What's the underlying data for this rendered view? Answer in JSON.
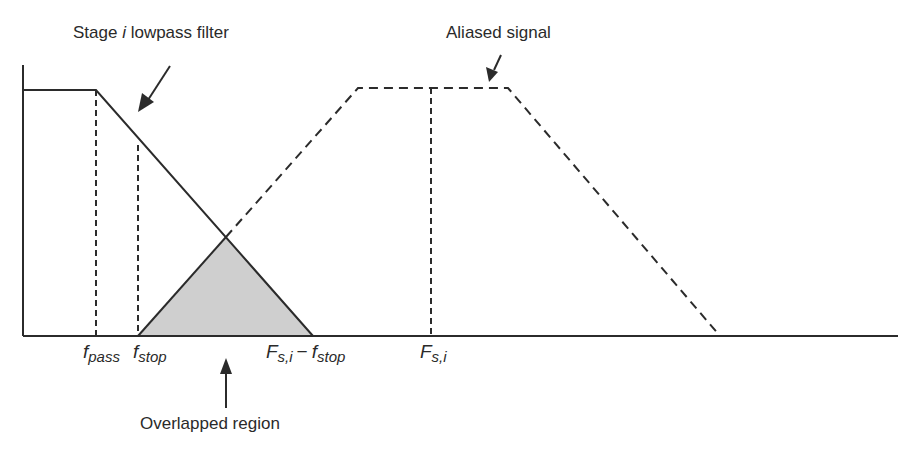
{
  "labels": {
    "filter_title_pre": "Stage ",
    "filter_title_var": "i",
    "filter_title_post": " lowpass filter",
    "aliased_signal": "Aliased signal",
    "overlapped_region": "Overlapped region"
  },
  "axis_ticks": {
    "f_pass": {
      "base": "f",
      "sub": "pass"
    },
    "f_stop": {
      "base": "f",
      "sub": "stop"
    },
    "fs_minus_fstop": {
      "base1": "F",
      "sub1": "s,i",
      "op": "−",
      "base2": "f",
      "sub2": "stop"
    },
    "fs": {
      "base": "F",
      "sub": "s,i"
    }
  },
  "colors": {
    "line": "#2b2b2b",
    "overlap_fill": "#cfcfcf",
    "background": "#ffffff"
  }
}
